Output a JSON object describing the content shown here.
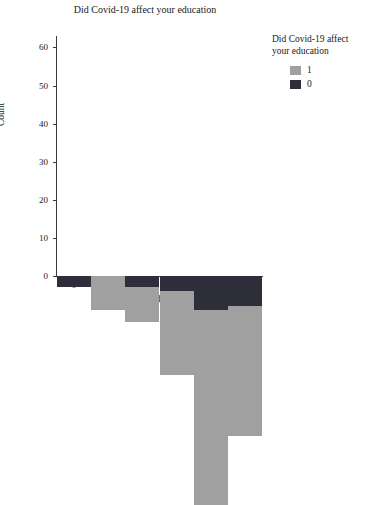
{
  "chart_data": {
    "type": "bar",
    "title": "Did Covid-19 affect your education",
    "xlabel": "Rank offline education system",
    "ylabel": "Count",
    "categories": [
      "0",
      "1",
      "2",
      "3",
      "4",
      "5"
    ],
    "xticks": [
      "0",
      "2",
      "4"
    ],
    "xtick_values": [
      0,
      2,
      4
    ],
    "yticks": [
      "0",
      "10",
      "20",
      "30",
      "40",
      "50",
      "60"
    ],
    "ytick_values": [
      0,
      10,
      20,
      30,
      40,
      50,
      60
    ],
    "ylim": [
      0,
      63
    ],
    "xlim": [
      -0.5,
      5.5
    ],
    "grid": false,
    "stacked": true,
    "legend_position": "right",
    "legend_title": "Did Covid-19 affect your education",
    "series": [
      {
        "name": "1",
        "color": "#a0a0a0",
        "values": [
          0,
          9,
          9,
          22,
          51,
          34
        ]
      },
      {
        "name": "0",
        "color": "#2e2e3a",
        "values": [
          3,
          0,
          3,
          4,
          9,
          8
        ]
      }
    ],
    "totals": [
      3,
      9,
      12,
      26,
      60,
      42
    ]
  },
  "legend": {
    "title_line1": "Did Covid-19 affect",
    "title_line2": "your education",
    "entries": [
      {
        "label": "1",
        "color": "#a0a0a0"
      },
      {
        "label": "0",
        "color": "#2e2e3a"
      }
    ]
  }
}
